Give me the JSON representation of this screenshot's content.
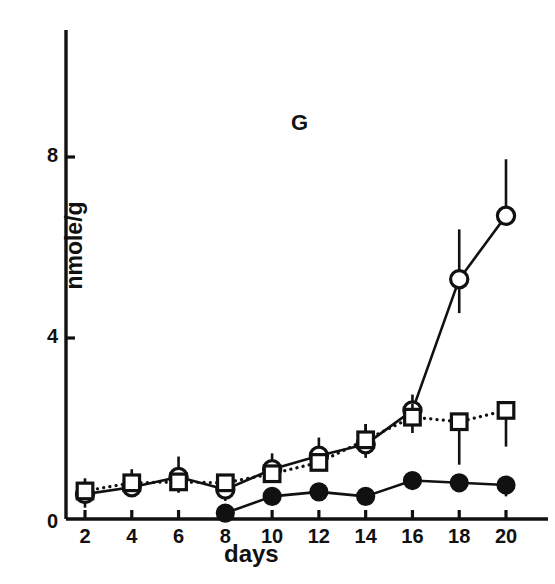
{
  "chart_data": {
    "type": "line",
    "title": "",
    "panel_label": "G",
    "xlabel": "days",
    "ylabel": "nmole/g",
    "xlim": [
      0,
      21.5
    ],
    "ylim": [
      0,
      9.6
    ],
    "xticks": [
      2,
      4,
      6,
      8,
      10,
      12,
      14,
      16,
      18,
      20
    ],
    "yticks": [
      0,
      4,
      8
    ],
    "xtick_labels": [
      "2",
      "4",
      "6",
      "8",
      "10",
      "12",
      "14",
      "16",
      "18",
      "20"
    ],
    "ytick_labels": [
      "0",
      "4",
      "8"
    ],
    "grid": false,
    "legend": "none",
    "series": [
      {
        "name": "open-circle-series",
        "marker": "open-circle",
        "line": "solid",
        "x": [
          2,
          4,
          6,
          8,
          10,
          12,
          14,
          16,
          18,
          20
        ],
        "values": [
          0.55,
          0.7,
          0.93,
          0.65,
          1.1,
          1.4,
          1.65,
          2.4,
          5.3,
          6.7
        ],
        "err_low": [
          0.3,
          0.2,
          0.35,
          0.25,
          0.3,
          0.3,
          0.3,
          0.0,
          0.75,
          0.0
        ],
        "err_high": [
          0.35,
          0.3,
          0.45,
          0.3,
          0.35,
          0.4,
          0.45,
          0.35,
          1.1,
          1.25
        ]
      },
      {
        "name": "open-square-series",
        "marker": "open-square",
        "line": "dotted",
        "x": [
          2,
          4,
          6,
          8,
          10,
          12,
          14,
          16,
          18,
          20
        ],
        "values": [
          0.62,
          0.8,
          0.82,
          0.8,
          1.0,
          1.25,
          1.75,
          2.25,
          2.15,
          2.4
        ],
        "err_low": [
          0.1,
          0.1,
          0.1,
          0.1,
          0.1,
          0.1,
          0.1,
          0.35,
          0.95,
          0.8
        ],
        "err_high": [
          0.1,
          0.3,
          0.1,
          0.1,
          0.1,
          0.1,
          0.35,
          0.3,
          0.0,
          0.0
        ]
      },
      {
        "name": "filled-circle-series",
        "marker": "filled-circle",
        "line": "solid",
        "x": [
          8,
          10,
          12,
          14,
          16,
          18,
          20
        ],
        "values": [
          0.13,
          0.5,
          0.6,
          0.5,
          0.85,
          0.8,
          0.75
        ],
        "err_low": [
          0.0,
          0.13,
          0.2,
          0.18,
          0.18,
          0.2,
          0.25
        ],
        "err_high": [
          0.0,
          0.0,
          0.0,
          0.12,
          0.0,
          0.0,
          0.0
        ]
      }
    ],
    "colors": {
      "axis": "#111111",
      "marker_edge": "#111111",
      "marker_fill_open": "#ffffff",
      "marker_fill_closed": "#111111"
    }
  }
}
